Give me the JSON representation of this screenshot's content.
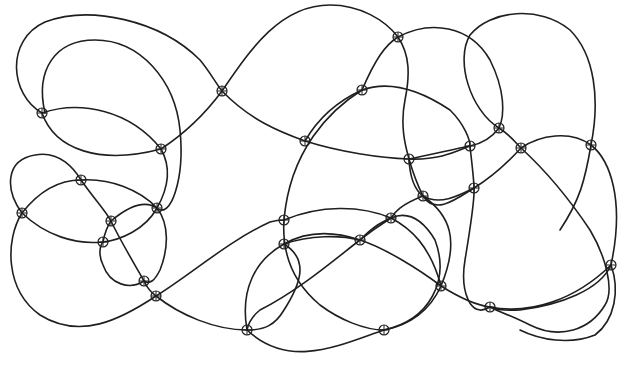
{
  "diagram": {
    "title": "",
    "colors": {
      "stroke": "#1f1f1f",
      "background": "#ffffff"
    },
    "marker": {
      "shape": "circle-with-cross",
      "radius": 5
    },
    "curves": [
      {
        "id": "c1",
        "d": "M42,113 C10,95 5,40 45,22 C90,5 160,20 200,60 C210,72 215,82 222,91 C250,120 280,132 305,141 C340,152 380,158 409,159 C440,160 455,152 470,146"
      },
      {
        "id": "c2",
        "d": "M42,113 C80,100 130,110 161,149 C170,165 170,185 157,208 C145,230 120,240 103,242"
      },
      {
        "id": "c3",
        "d": "M161,149 C190,130 208,110 222,91 C250,50 280,5 330,5 C360,5 385,20 398,37 C410,55 410,75 405,100 C400,125 405,145 409,159 C415,180 420,190 423,196"
      },
      {
        "id": "c4",
        "d": "M45,113 C35,70 55,40 95,40 C140,40 175,80 180,130 C185,180 170,220 157,208"
      },
      {
        "id": "c5",
        "d": "M42,113 C55,150 100,165 161,149"
      },
      {
        "id": "c6",
        "d": "M398,37 C430,20 470,25 490,60 C505,90 505,115 499,128 C490,140 480,144 470,146 C450,150 430,155 409,159"
      },
      {
        "id": "c7",
        "d": "M362,90 C390,80 420,90 450,110 C465,125 470,140 470,146 C472,165 474,180 474,188 C475,200 470,230 465,260 C460,290 470,320 490,307"
      },
      {
        "id": "c8",
        "d": "M305,141 C320,115 340,100 362,90 C375,60 385,45 398,37"
      },
      {
        "id": "c9",
        "d": "M362,90 C330,110 290,150 284,220 C282,250 290,280 320,305 C340,320 365,330 384,330"
      },
      {
        "id": "c10",
        "d": "M499,128 C470,110 455,60 470,35 C490,10 540,5 570,30 C595,55 600,100 591,145 C585,180 580,200 560,230"
      },
      {
        "id": "c11",
        "d": "M499,128 C510,135 515,142 521,148 C545,170 570,200 590,230 C605,255 615,290 605,305 C590,330 560,340 530,325 C510,315 495,310 490,307"
      },
      {
        "id": "c12",
        "d": "M409,159 C410,180 415,190 423,196 C440,206 460,195 474,188 C495,175 510,160 521,148 C540,135 570,130 591,145 C610,160 625,200 611,265 C600,290 560,305 520,310 C505,311 495,309 490,307"
      },
      {
        "id": "c13",
        "d": "M423,196 C400,205 395,212 391,218 C380,225 370,232 360,240 C340,255 300,290 260,310 C250,318 248,325 247,330"
      },
      {
        "id": "c14",
        "d": "M423,196 C450,215 460,240 441,286 C430,310 410,325 384,330"
      },
      {
        "id": "c15",
        "d": "M22,213 C5,190 5,160 35,155 C60,150 75,170 81,180 C95,200 105,210 111,221 C120,240 135,265 144,281 C148,290 152,293 156,296"
      },
      {
        "id": "c16",
        "d": "M22,213 C40,190 60,180 81,180 C110,178 140,190 157,208 C170,225 168,250 160,270 C155,280 150,285 144,281 C130,290 110,285 103,265 C98,255 100,245 103,242 C105,232 108,225 111,221 C130,205 145,200 157,208"
      },
      {
        "id": "c17",
        "d": "M22,213 C45,235 75,245 103,242"
      },
      {
        "id": "c18",
        "d": "M22,213 C5,240 5,290 40,315 C80,340 120,320 156,296 C190,275 230,240 270,222 C277,220 280,220 284,220 C320,205 360,205 391,218 C410,228 430,245 441,286"
      },
      {
        "id": "c19",
        "d": "M156,296 C180,315 215,330 247,330 C265,330 275,325 284,310 C300,285 310,260 284,244"
      },
      {
        "id": "c20",
        "d": "M284,244 C310,235 340,235 360,240 C385,248 420,270 441,286 C460,298 475,305 490,307 C530,315 575,300 611,265"
      },
      {
        "id": "c21",
        "d": "M247,330 C240,290 255,260 284,244 C305,232 330,230 360,240 C375,225 382,222 391,218 C405,212 420,215 435,240 C450,280 430,320 384,330 C340,345 290,370 247,330"
      },
      {
        "id": "c22",
        "d": "M474,188 C455,200 435,215 423,196"
      },
      {
        "id": "c23",
        "d": "M611,265 C620,290 615,320 595,335 C570,345 540,340 520,330"
      }
    ],
    "markers": [
      {
        "x": 42,
        "y": 113
      },
      {
        "x": 161,
        "y": 149
      },
      {
        "x": 222,
        "y": 91
      },
      {
        "x": 305,
        "y": 141
      },
      {
        "x": 398,
        "y": 37
      },
      {
        "x": 362,
        "y": 90
      },
      {
        "x": 409,
        "y": 159
      },
      {
        "x": 470,
        "y": 146
      },
      {
        "x": 499,
        "y": 128
      },
      {
        "x": 521,
        "y": 148
      },
      {
        "x": 591,
        "y": 145
      },
      {
        "x": 81,
        "y": 180
      },
      {
        "x": 22,
        "y": 213
      },
      {
        "x": 111,
        "y": 221
      },
      {
        "x": 157,
        "y": 208
      },
      {
        "x": 103,
        "y": 242
      },
      {
        "x": 144,
        "y": 281
      },
      {
        "x": 156,
        "y": 296
      },
      {
        "x": 423,
        "y": 196
      },
      {
        "x": 474,
        "y": 188
      },
      {
        "x": 391,
        "y": 218
      },
      {
        "x": 360,
        "y": 240
      },
      {
        "x": 284,
        "y": 220
      },
      {
        "x": 284,
        "y": 244
      },
      {
        "x": 611,
        "y": 265
      },
      {
        "x": 441,
        "y": 286
      },
      {
        "x": 490,
        "y": 307
      },
      {
        "x": 247,
        "y": 330
      },
      {
        "x": 384,
        "y": 330
      }
    ]
  }
}
